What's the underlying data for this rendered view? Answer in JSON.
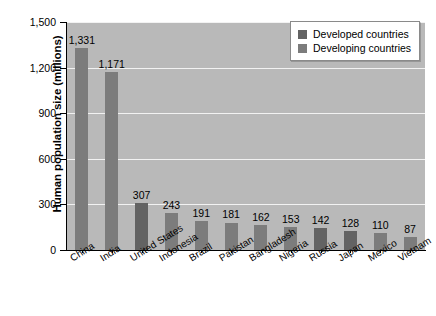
{
  "chart_data": {
    "type": "bar",
    "title": "",
    "subtitle": "",
    "xlabel": "",
    "ylabel": "Human population size (millions)",
    "ylim": [
      0,
      1500
    ],
    "ytick_labels": [
      "0",
      "300",
      "600",
      "900",
      "1,200",
      "1,500"
    ],
    "ytick_values": [
      0,
      300,
      600,
      900,
      1200,
      1500
    ],
    "grid": "horizontal",
    "legend_position": "top-right",
    "categories": [
      "China",
      "India",
      "United States",
      "Indonesia",
      "Brazil",
      "Pakistan",
      "Bangladesh",
      "Nigeria",
      "Russia",
      "Japan",
      "Mexico",
      "Vietnam"
    ],
    "values": [
      1331,
      1171,
      307,
      243,
      191,
      181,
      162,
      153,
      142,
      128,
      110,
      87
    ],
    "value_labels": [
      "1,331",
      "1,171",
      "307",
      "243",
      "191",
      "181",
      "162",
      "153",
      "142",
      "128",
      "110",
      "87"
    ],
    "groups": [
      "developing",
      "developing",
      "developed",
      "developing",
      "developing",
      "developing",
      "developing",
      "developing",
      "developed",
      "developed",
      "developing",
      "developing"
    ],
    "series": [
      {
        "name": "Developed countries",
        "color": "#636363",
        "points": [
          {
            "category": "United States",
            "value": 307
          },
          {
            "category": "Russia",
            "value": 142
          },
          {
            "category": "Japan",
            "value": 128
          }
        ]
      },
      {
        "name": "Developing countries",
        "color": "#7c7c7c",
        "points": [
          {
            "category": "China",
            "value": 1331
          },
          {
            "category": "India",
            "value": 1171
          },
          {
            "category": "Indonesia",
            "value": 243
          },
          {
            "category": "Brazil",
            "value": 191
          },
          {
            "category": "Pakistan",
            "value": 181
          },
          {
            "category": "Bangladesh",
            "value": 162
          },
          {
            "category": "Nigeria",
            "value": 153
          },
          {
            "category": "Mexico",
            "value": 110
          },
          {
            "category": "Vietnam",
            "value": 87
          }
        ]
      }
    ],
    "plot_background_color": "#b9b9b9",
    "gridline_color": "#f2f2f2"
  },
  "legend": {
    "items": [
      {
        "label": "Developed countries",
        "color": "#636363"
      },
      {
        "label": "Developing countries",
        "color": "#7c7c7c"
      }
    ]
  }
}
